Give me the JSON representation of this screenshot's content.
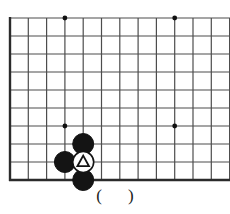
{
  "figure": {
    "kind": "go-board-corner-diagram",
    "width": 230,
    "height": 214,
    "background_color": "#ffffff"
  },
  "board": {
    "line_color": "#4d4d4d",
    "edge_line_color": "#2b2b2b",
    "origin_x": 10,
    "origin_y": 18,
    "spacing_x": 18.3,
    "spacing_y": 18,
    "columns": 13,
    "rows": 10,
    "bottom_edge_y": 180,
    "left_edge_x": 10,
    "star_point_color": "#111111",
    "star_point_radius": 2.4,
    "star_points": [
      {
        "name": "star-point-top-left",
        "col": 3,
        "row": 0
      },
      {
        "name": "star-point-top-right",
        "col": 9,
        "row": 0
      },
      {
        "name": "star-point-bottom-left",
        "col": 3,
        "row": 6
      },
      {
        "name": "star-point-bottom-right",
        "col": 9,
        "row": 6
      }
    ]
  },
  "stones": {
    "black_fill": "#141414",
    "white_fill": "#ffffff",
    "stone_outline": "#141414",
    "radius": 10.5,
    "items": [
      {
        "name": "black-stone-upper",
        "color": "black",
        "col": 4,
        "row": 7,
        "marker": "none"
      },
      {
        "name": "black-stone-left",
        "color": "black",
        "col": 3,
        "row": 8,
        "marker": "none"
      },
      {
        "name": "white-stone-marked",
        "color": "white",
        "col": 4,
        "row": 8,
        "marker": "triangle"
      },
      {
        "name": "black-stone-bottom",
        "color": "black",
        "col": 4,
        "row": 9,
        "marker": "none"
      }
    ]
  },
  "marker": {
    "triangle_color": "#141414",
    "triangle_symbol": "triangle-marker"
  },
  "caption": {
    "open_paren": "(",
    "inner_text": "",
    "close_paren": ")"
  }
}
